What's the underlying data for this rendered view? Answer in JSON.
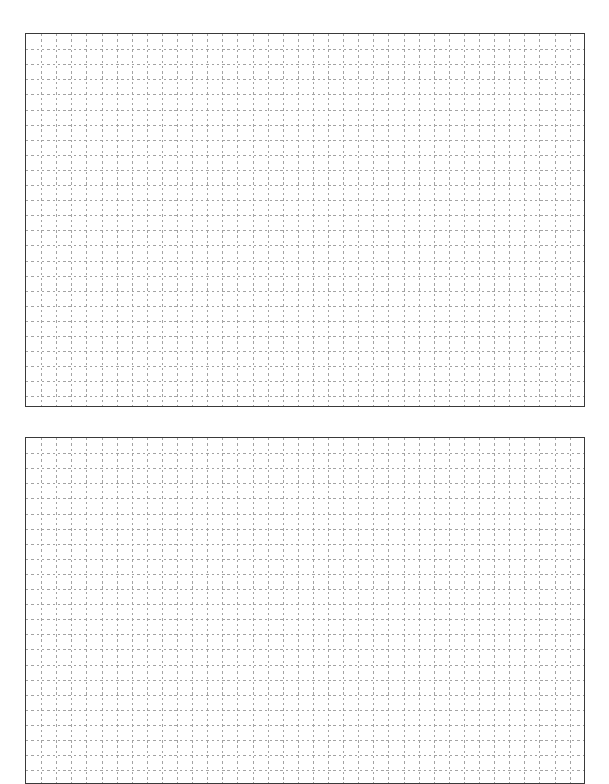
{
  "page": {
    "width": 609,
    "height": 784,
    "background_color": "#ffffff"
  },
  "clipped_caption": {
    "text": "",
    "note": "top line of text is clipped off the top edge; only descender fragments render"
  },
  "grid_style": {
    "line_color": "#a3a3a3",
    "border_color": "#3a3a3a",
    "cell_size_px": 15.1,
    "dash_on_px": 2.4,
    "dash_off_px": 2.9,
    "border_width_px": 1.5,
    "fill_color": "#ffffff"
  },
  "panels": [
    {
      "name": "grid-panel-top",
      "x": 25,
      "y": 33,
      "width": 560,
      "height": 374,
      "columns": 37,
      "rows": 25,
      "clipped": false
    },
    {
      "name": "grid-panel-bottom",
      "x": 25,
      "y": 437,
      "width": 560,
      "height": 347,
      "columns": 37,
      "rows": 23,
      "clipped": true
    }
  ]
}
